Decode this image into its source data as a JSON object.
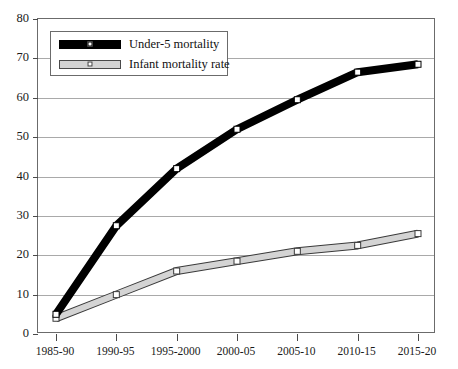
{
  "chart_data": {
    "type": "line",
    "title": "",
    "subtitle": "",
    "xlabel": "",
    "ylabel": "",
    "categories": [
      "1985-90",
      "1990-95",
      "1995-2000",
      "2000-05",
      "2005-10",
      "2010-15",
      "2015-20"
    ],
    "series": [
      {
        "name": "Under-5 mortality",
        "values": [
          5,
          27.5,
          42,
          52,
          59.5,
          66.5,
          68.5
        ],
        "color": "#000000",
        "marker": "white-square"
      },
      {
        "name": "Infant mortality rate",
        "values": [
          4,
          10,
          16,
          18.5,
          21,
          22.5,
          25.5
        ],
        "color": "#d4d4d4",
        "marker": "white-square"
      }
    ],
    "ylim": [
      0,
      80
    ],
    "ytick_values": [
      0,
      10,
      20,
      30,
      40,
      50,
      60,
      70,
      80
    ],
    "ytick_labels": [
      "0",
      "10",
      "20",
      "30",
      "40",
      "50",
      "60",
      "70",
      "80"
    ],
    "grid": true,
    "grid_color": "#a9a9a9",
    "legend_position": "upper-left",
    "frame_color": "#6b6b6b",
    "background": "#ffffff"
  },
  "legend": {
    "items": [
      {
        "label": "Under-5 mortality"
      },
      {
        "label": "Infant mortality rate"
      }
    ]
  }
}
